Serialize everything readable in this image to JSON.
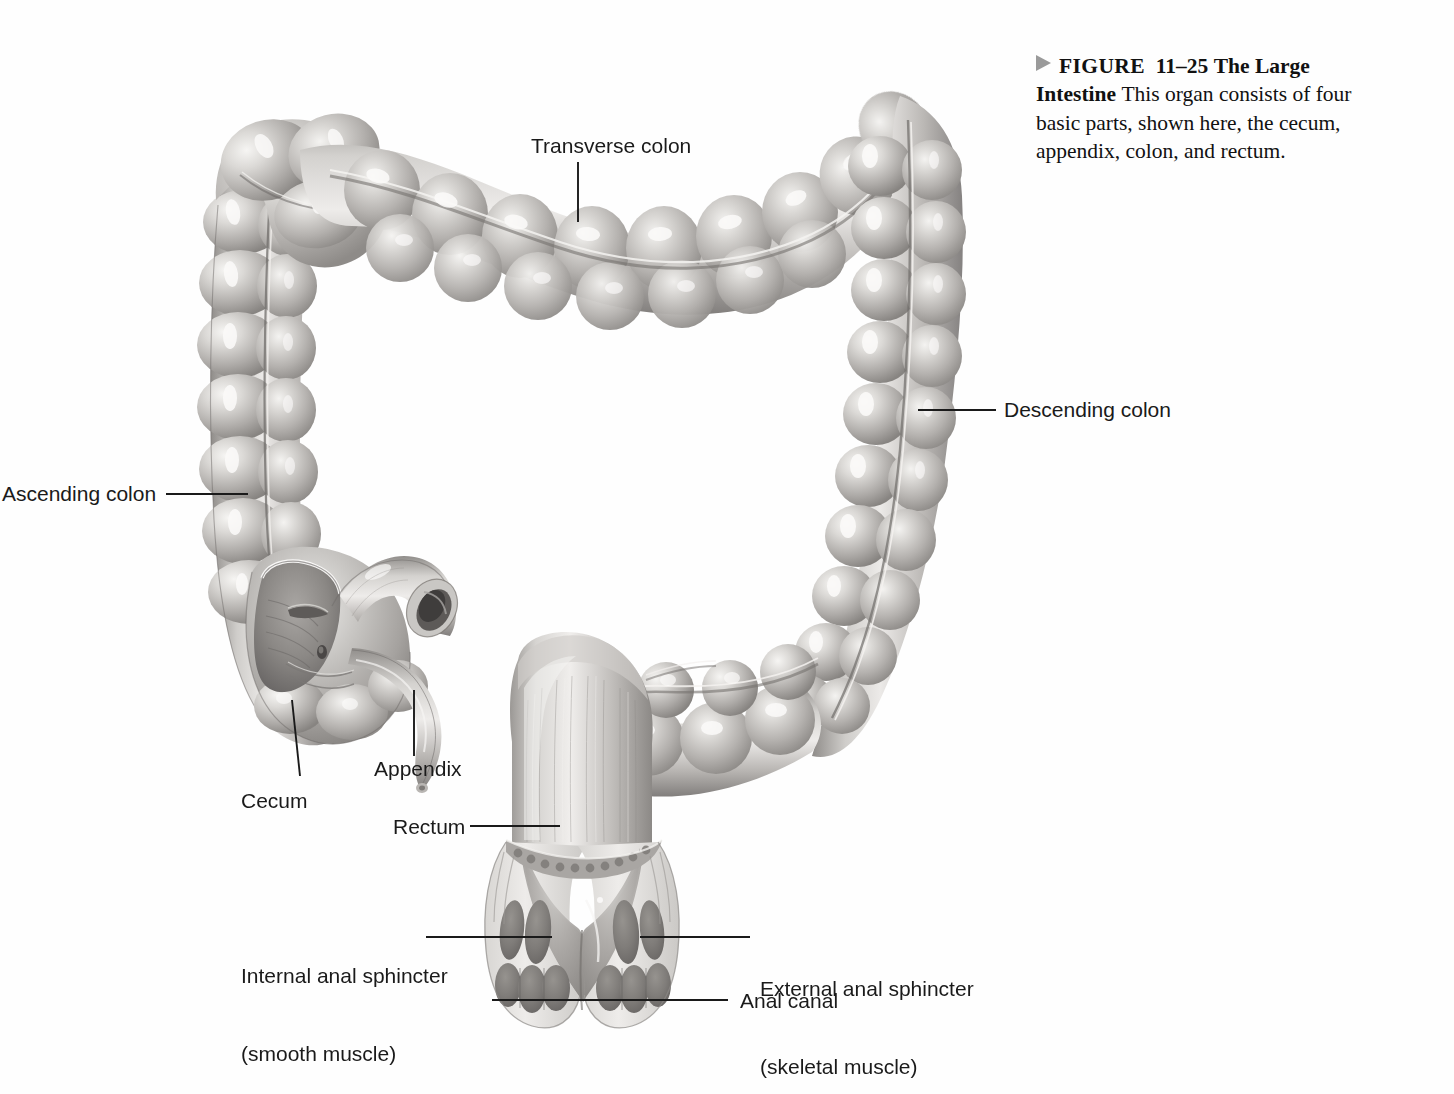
{
  "figure": {
    "marker_icon": "right-triangle-icon",
    "number_prefix": "FIGURE",
    "number": "11–25",
    "title": "The Large Intestine",
    "body": "This organ consists of four basic parts, shown here, the cecum, appendix, colon, and rectum."
  },
  "illustration": {
    "alt": "Large intestine anatomical drawing",
    "background_color": "#ffffff",
    "ink_color": "#1a1a1a",
    "tissue_light": "#e2e0de",
    "tissue_mid": "#b3b0ae",
    "tissue_dark": "#8a8784",
    "muscle_dark": "#7e7b78"
  },
  "labels": [
    {
      "id": "transverse-colon",
      "text": "Transverse colon"
    },
    {
      "id": "descending-colon",
      "text": "Descending colon"
    },
    {
      "id": "ascending-colon",
      "text": "Ascending colon"
    },
    {
      "id": "appendix",
      "text": "Appendix"
    },
    {
      "id": "cecum",
      "text": "Cecum"
    },
    {
      "id": "rectum",
      "text": "Rectum"
    },
    {
      "id": "internal-anal-sphincter",
      "line1": "Internal anal sphincter",
      "line2": "(smooth muscle)"
    },
    {
      "id": "external-anal-sphincter",
      "line1": "External anal sphincter",
      "line2": "(skeletal muscle)"
    },
    {
      "id": "anal-canal",
      "text": "Anal canal"
    }
  ]
}
